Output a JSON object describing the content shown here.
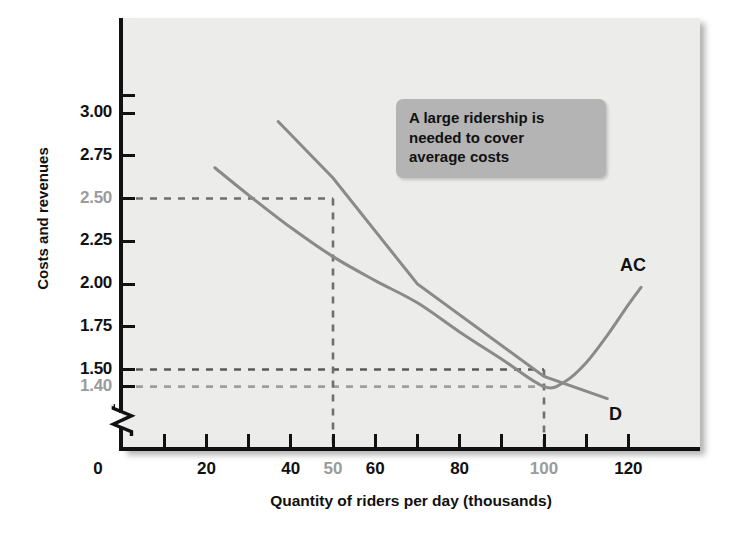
{
  "chart_data": {
    "type": "line",
    "title": "",
    "xlabel": "Quantity of riders per day (thousands)",
    "ylabel": "Costs and revenues",
    "xlim": [
      0,
      130
    ],
    "ylim": [
      1.3,
      3.1
    ],
    "grid": false,
    "legend": "inline-curve-labels",
    "x_ticks": [
      0,
      10,
      20,
      30,
      40,
      50,
      60,
      70,
      80,
      90,
      100,
      110,
      120
    ],
    "x_tick_labels": [
      {
        "value": 0,
        "text": "0",
        "muted": false
      },
      {
        "value": 20,
        "text": "20",
        "muted": false
      },
      {
        "value": 40,
        "text": "40",
        "muted": false
      },
      {
        "value": 50,
        "text": "50",
        "muted": true
      },
      {
        "value": 60,
        "text": "60",
        "muted": false
      },
      {
        "value": 80,
        "text": "80",
        "muted": false
      },
      {
        "value": 100,
        "text": "100",
        "muted": true
      },
      {
        "value": 120,
        "text": "120",
        "muted": false
      }
    ],
    "y_ticks": [
      1.4,
      1.5,
      1.75,
      2.0,
      2.25,
      2.5,
      2.75,
      3.0,
      3.1
    ],
    "y_tick_labels": [
      {
        "value": 1.4,
        "text": "1.40",
        "muted": true
      },
      {
        "value": 1.5,
        "text": "1.50",
        "muted": false
      },
      {
        "value": 1.75,
        "text": "1.75",
        "muted": false
      },
      {
        "value": 2.0,
        "text": "2.00",
        "muted": false
      },
      {
        "value": 2.25,
        "text": "2.25",
        "muted": false
      },
      {
        "value": 2.5,
        "text": "2.50",
        "muted": true
      },
      {
        "value": 2.75,
        "text": "2.75",
        "muted": false
      },
      {
        "value": 3.0,
        "text": "3.00",
        "muted": false
      }
    ],
    "y_axis_break": true,
    "series": [
      {
        "name": "AC",
        "label": "AC",
        "color": "#8a8a8a",
        "description": "U-shaped average cost curve, minimum at quantity 100 with cost 1.40",
        "points": [
          [
            22,
            2.68
          ],
          [
            30,
            2.52
          ],
          [
            40,
            2.33
          ],
          [
            50,
            2.16
          ],
          [
            60,
            2.02
          ],
          [
            70,
            1.89
          ],
          [
            80,
            1.72
          ],
          [
            90,
            1.56
          ],
          [
            100,
            1.4
          ],
          [
            105,
            1.43
          ],
          [
            110,
            1.54
          ],
          [
            115,
            1.7
          ],
          [
            120,
            1.88
          ],
          [
            123,
            1.98
          ]
        ]
      },
      {
        "name": "D",
        "label": "D",
        "color": "#8a8a8a",
        "description": "Downward-sloping linear demand curve",
        "points": [
          [
            37,
            2.95
          ],
          [
            50,
            2.62
          ],
          [
            70,
            2.0
          ],
          [
            100,
            1.46
          ],
          [
            115,
            1.33
          ]
        ]
      }
    ],
    "reference_lines": [
      {
        "name": "price-2.50",
        "axis": "y",
        "value": 2.5,
        "style": "dashed",
        "color": "#6f6f6f",
        "x_end": 50
      },
      {
        "name": "price-1.50",
        "axis": "y",
        "value": 1.5,
        "style": "dashed",
        "color": "#5a5a5a",
        "x_end": 100
      },
      {
        "name": "cost-1.40",
        "axis": "y",
        "value": 1.4,
        "style": "dashed",
        "color": "#9f9f9f",
        "x_end": 100
      },
      {
        "name": "quantity-50",
        "axis": "x",
        "value": 50,
        "style": "dashed",
        "color": "#6f6f6f",
        "y_end": 2.5
      },
      {
        "name": "quantity-100",
        "axis": "x",
        "value": 100,
        "style": "dashed",
        "color": "#6f6f6f",
        "y_end": 1.5
      }
    ],
    "annotations": [
      {
        "name": "callout",
        "lines": [
          "A large ridership is",
          "needed to cover",
          "average costs"
        ]
      }
    ]
  },
  "annotation": {
    "line1": "A large ridership is",
    "line2": "needed to cover",
    "line3": "average costs"
  },
  "axis": {
    "y_title": "Costs and revenues",
    "x_title": "Quantity of riders per day (thousands)"
  },
  "curves": {
    "ac_label": "AC",
    "d_label": "D"
  },
  "colors": {
    "panel_background": "#ececeb",
    "axis": "#111111",
    "curve": "#8a8a8a",
    "muted_text": "#9b9b9b",
    "callout_background": "#b4b4b4"
  }
}
